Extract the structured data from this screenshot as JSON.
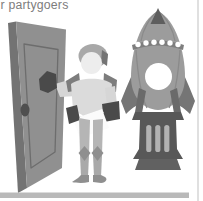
{
  "card": {
    "title_fragment": "r partygoers"
  },
  "colors": {
    "background": "#ffffff",
    "title_text": "#7d7d7d",
    "door_face": "#909090",
    "door_edge": "#737373",
    "door_panel_line": "#6d6d6d",
    "door_knob": "#4f4f4f",
    "skin": "#ededed",
    "helmet": "#a8a8a8",
    "helmet_accent": "#747474",
    "armor_dark": "#7d7d7d",
    "gauntlet": "#4a4a4a",
    "sleeve": "#d6d6d6",
    "tunic": "#dbdbdb",
    "legs": "#b5b5b5",
    "legs_lower": "#a9a9a9",
    "boots": "#8f8f8f",
    "envelope": "#fbfbfb",
    "envelope_shadow": "#d0d0d0",
    "rocket_body": "#9c9c9c",
    "rocket_nose": "#5e5e5e",
    "rocket_seam": "#8a8a8a",
    "rocket_band": "#7e7e7e",
    "rocket_dot": "#ffffff",
    "porthole": "#ffffff",
    "rocket_fin": "#757575",
    "rocket_strap": "#6a6a6a",
    "rocket_engine": "#585858",
    "engine_slot": "#b2b2b2",
    "rocket_foot": "#616161",
    "ground_bar": "#b9b9b9",
    "card_border": "#d9d9d9"
  }
}
